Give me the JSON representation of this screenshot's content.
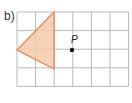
{
  "part_label": "b)",
  "grid": {
    "cols": 6,
    "rows": 4,
    "x0": 17,
    "y0": 12,
    "cell": 18.6,
    "line_color": "#b9b9b9"
  },
  "triangle": {
    "vertices": [
      [
        17,
        50
      ],
      [
        54,
        12
      ],
      [
        54,
        69
      ]
    ],
    "fill": "#f4c9a8",
    "stroke": "#e48a5a"
  },
  "point": {
    "label": "P",
    "x": 72,
    "y": 50,
    "color": "#111111"
  }
}
